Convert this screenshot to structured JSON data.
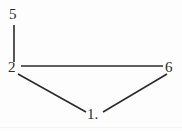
{
  "figure": {
    "type": "graph-diagram",
    "width": 182,
    "height": 131,
    "background_color": "#fdfdfd",
    "stroke_color": "#2b2b2b",
    "text_color": "#2b2b2b",
    "stroke_width": 1.6
  },
  "nodes": [
    {
      "id": "n5",
      "label": "5",
      "x": 14,
      "y": 15,
      "label_x": 9,
      "label_y": 7
    },
    {
      "id": "n2",
      "label": "2",
      "x": 14,
      "y": 68,
      "label_x": 8,
      "label_y": 60
    },
    {
      "id": "n6",
      "label": "6",
      "x": 170,
      "y": 68,
      "label_x": 165,
      "label_y": 60
    },
    {
      "id": "n1",
      "label": "1.",
      "x": 94,
      "y": 114,
      "label_x": 87,
      "label_y": 107
    }
  ],
  "edges": [
    {
      "id": "e-5-2",
      "from": "5",
      "to": "2",
      "x1": 14,
      "y1": 25,
      "x2": 14,
      "y2": 62
    },
    {
      "id": "e-2-6",
      "from": "2",
      "to": "6",
      "x1": 21,
      "y1": 66,
      "x2": 163,
      "y2": 66
    },
    {
      "id": "e-2-1",
      "from": "2",
      "to": "1",
      "x1": 18,
      "y1": 74,
      "x2": 86,
      "y2": 112
    },
    {
      "id": "e-1-6",
      "from": "1",
      "to": "6",
      "x1": 103,
      "y1": 112,
      "x2": 167,
      "y2": 74
    }
  ]
}
